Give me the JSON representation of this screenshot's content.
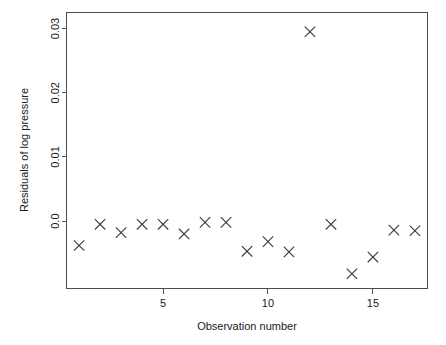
{
  "chart_data": {
    "type": "scatter",
    "title": "",
    "xlabel": "Observation number",
    "ylabel": "Residuals of log pressure",
    "xlim": [
      0.4,
      17.6
    ],
    "ylim": [
      -0.0105,
      0.0325
    ],
    "xticks": [
      5,
      10,
      15
    ],
    "xtick_labels": [
      "5",
      "10",
      "15"
    ],
    "yticks": [
      0.0,
      0.01,
      0.02,
      0.03
    ],
    "ytick_labels": [
      "0.0",
      "0.01",
      "0.02",
      "0.03"
    ],
    "grid": false,
    "legend": "none",
    "marker": "x-cross",
    "marker_color": "#3d3d3d",
    "box_color": "#4d4d4d",
    "x": [
      1,
      2,
      3,
      4,
      5,
      6,
      7,
      8,
      9,
      10,
      11,
      12,
      13,
      14,
      15,
      16,
      17
    ],
    "values": [
      -0.0038,
      -0.0005,
      -0.0018,
      -0.0005,
      -0.0005,
      -0.002,
      -0.0002,
      -0.0002,
      -0.0047,
      -0.0032,
      -0.0048,
      0.0295,
      -0.0005,
      -0.0082,
      -0.0056,
      -0.0014,
      -0.0015
    ],
    "points": [
      {
        "x": 1,
        "y": -0.0038
      },
      {
        "x": 2,
        "y": -0.0005
      },
      {
        "x": 3,
        "y": -0.0018
      },
      {
        "x": 4,
        "y": -0.0005
      },
      {
        "x": 5,
        "y": -0.0005
      },
      {
        "x": 6,
        "y": -0.002
      },
      {
        "x": 7,
        "y": -0.0002
      },
      {
        "x": 8,
        "y": -0.0002
      },
      {
        "x": 9,
        "y": -0.0047
      },
      {
        "x": 10,
        "y": -0.0032
      },
      {
        "x": 11,
        "y": -0.0048
      },
      {
        "x": 12,
        "y": 0.0295
      },
      {
        "x": 13,
        "y": -0.0005
      },
      {
        "x": 14,
        "y": -0.0082
      },
      {
        "x": 15,
        "y": -0.0056
      },
      {
        "x": 16,
        "y": -0.0014
      },
      {
        "x": 17,
        "y": -0.0015
      }
    ]
  },
  "axes": {
    "x_title": "Observation number",
    "y_title": "Residuals of log pressure"
  }
}
